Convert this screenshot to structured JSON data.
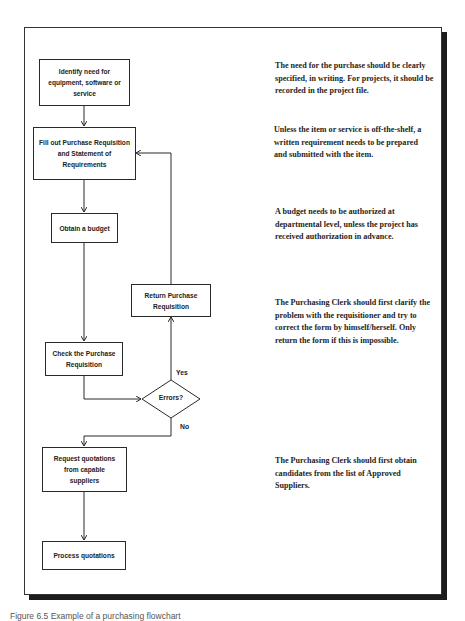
{
  "flowchart": {
    "steps": [
      {
        "id": "identify",
        "label": "Identify need for equipment, software or service"
      },
      {
        "id": "fill-out",
        "label": "Fill out Purchase Requisition and Statement of Requirements"
      },
      {
        "id": "budget",
        "label": "Obtain a budget"
      },
      {
        "id": "return",
        "label": "Return Purchase Requisition"
      },
      {
        "id": "check",
        "label": "Check the Purchase Requisition"
      },
      {
        "id": "request",
        "label": "Request quotations from capable suppliers"
      },
      {
        "id": "process",
        "label": "Process quotations"
      }
    ],
    "decision": {
      "label": "Errors?",
      "yes_label": "Yes",
      "no_label": "No"
    },
    "colors": {
      "line": "#2a2a2a",
      "frame_shadow": "#1c1c1c",
      "background": "#ffffff"
    }
  },
  "notes": [
    "The need for the purchase should be clearly specified, in writing. For projects, it should be recorded in the project file.",
    "Unless the item or service is off-the-shelf, a written requirement needs to be prepared and submitted with the item.",
    "A budget needs to be authorized at departmental level, unless the project has received authorization in advance.",
    "The Purchasing Clerk should first clarify the problem with the requisitioner and try to correct the form by himself/herself.  Only return the form if this is impossible.",
    "The Purchasing Clerk should first obtain candidates from the list of Approved Suppliers."
  ],
  "caption": "Figure 6.5  Example of a purchasing flowchart"
}
